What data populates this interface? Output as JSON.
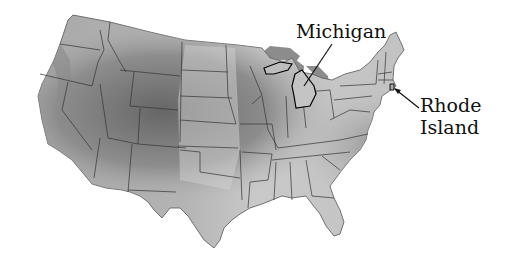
{
  "map": {
    "subject": "Contiguous United States relief map (grayscale)",
    "style": "shaded relief with state borders",
    "colors": {
      "background": "#ffffff",
      "land_light": "#d4d4d4",
      "land_mid": "#a9a9a9",
      "land_dark": "#6f6f6f",
      "lakes": "#8c8c8c",
      "borders": "#333333",
      "highlight_border": "#000000",
      "label_text": "#111111"
    },
    "labels": [
      {
        "id": "michigan",
        "text": "Michigan",
        "anchor": [
          296,
          20
        ],
        "points_to": [
          305,
          86
        ]
      },
      {
        "id": "rhode_island",
        "text_line1": "Rhode",
        "text_line2": "Island",
        "anchor": [
          420,
          94
        ],
        "points_to": [
          394,
          88
        ]
      }
    ]
  },
  "labels": {
    "michigan": "Michigan",
    "rhode_line1": "Rhode",
    "rhode_line2": "Island"
  }
}
